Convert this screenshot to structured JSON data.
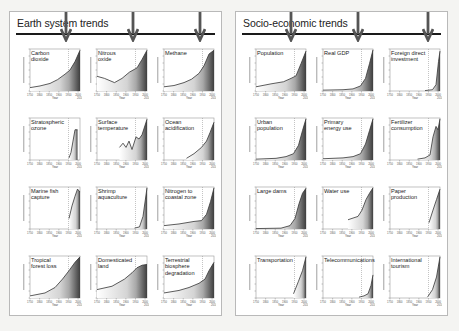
{
  "panels": [
    {
      "title": "Earth system trends",
      "arrows_x": [
        56,
        123,
        190
      ],
      "charts": [
        {
          "label": "Carbon\ndioxide"
        },
        {
          "label": "Nitrous\noxide"
        },
        {
          "label": "Methane"
        },
        {
          "label": "Stratospheric\nozone"
        },
        {
          "label": "Surface\ntemperature"
        },
        {
          "label": "Ocean\nacidification"
        },
        {
          "label": "Marine fish\ncapture"
        },
        {
          "label": "Shrimp\naquaculture"
        },
        {
          "label": "Nitrogen to\ncoastal zone"
        },
        {
          "label": "Tropical\nforest loss"
        },
        {
          "label": "Domesticated\nland"
        },
        {
          "label": "Terrestrial\nbiosphere\ndegradation"
        }
      ]
    },
    {
      "title": "Socio-economic trends",
      "arrows_x": [
        55,
        122,
        192
      ],
      "charts": [
        {
          "label": "Population"
        },
        {
          "label": "Real GDP"
        },
        {
          "label": "Foreign direct\ninvestment"
        },
        {
          "label": "Urban\npopulation"
        },
        {
          "label": "Primary\nenergy use"
        },
        {
          "label": "Fertilizer\nconsumption"
        },
        {
          "label": "Large dams"
        },
        {
          "label": "Water use"
        },
        {
          "label": "Paper\nproduction"
        },
        {
          "label": "Transportation"
        },
        {
          "label": "Telecommunications"
        },
        {
          "label": "International\ntourism"
        }
      ]
    }
  ],
  "axis": {
    "x_ticks": [
      "1750",
      "1800",
      "1850",
      "1900",
      "1950",
      "2000"
    ],
    "x_end": "2010",
    "xlabel": "Year"
  },
  "chart_data": [
    {
      "type": "area",
      "title": "Carbon dioxide",
      "x": [
        1750,
        1800,
        1850,
        1900,
        1950,
        2000,
        2010
      ],
      "values": [
        277,
        282,
        285,
        296,
        311,
        369,
        389
      ],
      "xlabel": "Year",
      "ylabel": "Atmospheric conc., ppm"
    },
    {
      "type": "area",
      "title": "Nitrous oxide",
      "x": [
        1750,
        1800,
        1850,
        1900,
        1950,
        2000,
        2010
      ],
      "values": [
        270,
        271,
        270,
        280,
        289,
        316,
        323
      ],
      "xlabel": "Year",
      "ylabel": "Atmospheric conc., ppb"
    },
    {
      "type": "area",
      "title": "Methane",
      "x": [
        1750,
        1800,
        1850,
        1900,
        1950,
        2000,
        2010
      ],
      "values": [
        720,
        730,
        790,
        880,
        1150,
        1750,
        1800
      ],
      "xlabel": "Year",
      "ylabel": "Atmospheric conc., ppb"
    },
    {
      "type": "area",
      "title": "Stratospheric ozone",
      "x": [
        1950,
        1970,
        1980,
        1990,
        2000,
        2010
      ],
      "values": [
        0,
        2,
        10,
        30,
        40,
        40
      ],
      "xlabel": "Year",
      "ylabel": "% loss"
    },
    {
      "type": "area",
      "title": "Surface temperature",
      "x": [
        1850,
        1880,
        1900,
        1920,
        1950,
        1980,
        2000,
        2010
      ],
      "values": [
        -0.3,
        -0.2,
        -0.4,
        -0.3,
        -0.1,
        0.1,
        0.4,
        0.6
      ],
      "xlabel": "Year",
      "ylabel": "Temperature anomaly, °C"
    },
    {
      "type": "area",
      "title": "Ocean acidification",
      "x": [
        1850,
        1900,
        1950,
        2000,
        2010
      ],
      "values": [
        8.5,
        8.5,
        8.8,
        9.5,
        10.0
      ],
      "xlabel": "Year",
      "ylabel": "Hydrogen ion, nmol/kg"
    },
    {
      "type": "area",
      "title": "Marine fish capture",
      "x": [
        1950,
        1970,
        1990,
        2000,
        2010
      ],
      "values": [
        20,
        60,
        85,
        90,
        80
      ],
      "xlabel": "Year",
      "ylabel": "Million tonnes"
    },
    {
      "type": "area",
      "title": "Shrimp aquaculture",
      "x": [
        1950,
        1980,
        1990,
        2000,
        2010
      ],
      "values": [
        0,
        0.1,
        0.8,
        1.5,
        3.5
      ],
      "xlabel": "Year",
      "ylabel": "Million tonnes"
    },
    {
      "type": "area",
      "title": "Nitrogen to coastal zone",
      "x": [
        1750,
        1850,
        1950,
        2000,
        2010
      ],
      "values": [
        10,
        12,
        16,
        45,
        60
      ],
      "xlabel": "Year",
      "ylabel": "Human N flux, Mtons/yr"
    },
    {
      "type": "area",
      "title": "Tropical forest loss",
      "x": [
        1750,
        1850,
        1900,
        1950,
        2000,
        2010
      ],
      "values": [
        2,
        6,
        10,
        18,
        28,
        30
      ],
      "xlabel": "Year",
      "ylabel": "% loss"
    },
    {
      "type": "area",
      "title": "Domesticated land",
      "x": [
        1750,
        1850,
        1900,
        1950,
        2000,
        2010
      ],
      "values": [
        8,
        12,
        18,
        28,
        33,
        34
      ],
      "xlabel": "Year",
      "ylabel": "% of total land area"
    },
    {
      "type": "area",
      "title": "Terrestrial biosphere degradation",
      "x": [
        1750,
        1850,
        1900,
        1950,
        2000,
        2010
      ],
      "values": [
        2,
        4,
        6,
        8,
        16,
        20
      ],
      "xlabel": "Year",
      "ylabel": "% decrease mean species abundance"
    },
    {
      "type": "area",
      "title": "Population",
      "x": [
        1750,
        1800,
        1850,
        1900,
        1950,
        2000,
        2010
      ],
      "values": [
        0.8,
        1.0,
        1.3,
        1.6,
        2.5,
        6.1,
        6.9
      ],
      "xlabel": "Year",
      "ylabel": "Billion"
    },
    {
      "type": "area",
      "title": "Real GDP",
      "x": [
        1750,
        1850,
        1900,
        1950,
        2000,
        2010
      ],
      "values": [
        0.5,
        1,
        2,
        5,
        40,
        55
      ],
      "xlabel": "Year",
      "ylabel": "Trillion US dollars"
    },
    {
      "type": "area",
      "title": "Foreign direct investment",
      "x": [
        1950,
        1980,
        1990,
        2000,
        2010
      ],
      "values": [
        0,
        0.05,
        0.2,
        1.4,
        1.5
      ],
      "xlabel": "Year",
      "ylabel": "Trillion US dollars"
    },
    {
      "type": "area",
      "title": "Urban population",
      "x": [
        1750,
        1850,
        1900,
        1950,
        2000,
        2010
      ],
      "values": [
        0.1,
        0.15,
        0.2,
        0.7,
        2.9,
        3.5
      ],
      "xlabel": "Year",
      "ylabel": "Billion"
    },
    {
      "type": "area",
      "title": "Primary energy use",
      "x": [
        1750,
        1850,
        1900,
        1950,
        2000,
        2010
      ],
      "values": [
        20,
        40,
        50,
        80,
        420,
        520
      ],
      "xlabel": "Year",
      "ylabel": "Exajoule (EJ)"
    },
    {
      "type": "area",
      "title": "Fertilizer consumption",
      "x": [
        1900,
        1950,
        1980,
        1990,
        2000,
        2010
      ],
      "values": [
        0,
        15,
        120,
        140,
        135,
        180
      ],
      "xlabel": "Year",
      "ylabel": "Million tonnes"
    },
    {
      "type": "area",
      "title": "Large dams",
      "x": [
        1750,
        1900,
        1950,
        1980,
        2000,
        2010
      ],
      "values": [
        0,
        1,
        5,
        30,
        45,
        48
      ],
      "xlabel": "Year",
      "ylabel": "Thousand dams"
    },
    {
      "type": "area",
      "title": "Water use",
      "x": [
        1900,
        1950,
        1980,
        2000,
        2010
      ],
      "values": [
        0.6,
        1.2,
        3,
        3.8,
        4.0
      ],
      "xlabel": "Year",
      "ylabel": "Thousand km³"
    },
    {
      "type": "area",
      "title": "Paper production",
      "x": [
        1960,
        1980,
        2000,
        2010
      ],
      "values": [
        80,
        170,
        320,
        400
      ],
      "xlabel": "Year",
      "ylabel": "Million tonnes"
    },
    {
      "type": "area",
      "title": "Transportation",
      "x": [
        1960,
        1980,
        2000,
        2010
      ],
      "values": [
        100,
        350,
        700,
        1000
      ],
      "xlabel": "Year",
      "ylabel": "Million motor vehicles"
    },
    {
      "type": "area",
      "title": "Telecommunications",
      "x": [
        1950,
        1990,
        2000,
        2010
      ],
      "values": [
        0,
        0.5,
        1.5,
        6
      ],
      "xlabel": "Year",
      "ylabel": "Billion phone subscriptions"
    },
    {
      "type": "area",
      "title": "International tourism",
      "x": [
        1960,
        1980,
        2000,
        2010
      ],
      "values": [
        50,
        280,
        680,
        950
      ],
      "xlabel": "Year",
      "ylabel": "Million arrivals"
    }
  ]
}
